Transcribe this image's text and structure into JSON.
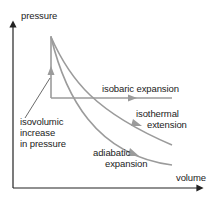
{
  "diagram": {
    "axes": {
      "y_label": "pressure",
      "x_label": "volume"
    },
    "processes": [
      {
        "id": "isovolumic",
        "label_lines": [
          "isovolumic",
          "increase",
          "in pressure"
        ]
      },
      {
        "id": "isobaric",
        "label": "isobaric expansion"
      },
      {
        "id": "isothermal",
        "label_lines": [
          "isothermal",
          "extension"
        ]
      },
      {
        "id": "adiabatic",
        "label_lines": [
          "adiabatic",
          "expansion"
        ]
      }
    ],
    "colors": {
      "axis": "#222222",
      "curve": "#9b9b9b",
      "text": "#222222"
    }
  }
}
